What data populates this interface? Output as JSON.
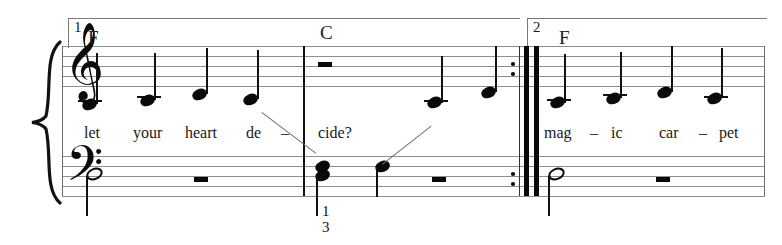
{
  "score": {
    "title_visible": false,
    "system": {
      "width": 782,
      "height": 245
    },
    "brace": {
      "name": "piano-brace"
    },
    "clefs": [
      {
        "name": "treble-clef",
        "glyph": "𝄞",
        "staff": "treble"
      },
      {
        "name": "bass-clef",
        "glyph": "𝄢",
        "staff": "bass"
      }
    ],
    "voltas": [
      {
        "number": "1",
        "name": "volta-1"
      },
      {
        "number": "2",
        "name": "volta-2"
      }
    ],
    "chords": [
      {
        "symbol": "F",
        "name": "chord-symbol-f-1"
      },
      {
        "symbol": "C",
        "name": "chord-symbol-c"
      },
      {
        "symbol": "F",
        "symbol_name": "chord-symbol-f-2"
      }
    ],
    "chord_list": [
      "F",
      "C",
      "F"
    ],
    "lyrics_measure_1": [
      {
        "text": "let"
      },
      {
        "text": "your"
      },
      {
        "text": "heart"
      },
      {
        "text": "de"
      },
      {
        "text": "–"
      }
    ],
    "lyrics_measure_2": [
      {
        "text": "cide?"
      }
    ],
    "lyrics_measure_3": [
      {
        "text": "mag"
      },
      {
        "text": "–"
      },
      {
        "text": "ic"
      },
      {
        "text": "car"
      },
      {
        "text": "–"
      },
      {
        "text": "pet"
      }
    ],
    "fingerings": [
      {
        "value": "1",
        "name": "fingering-1"
      },
      {
        "value": "3",
        "name": "fingering-3"
      }
    ],
    "rests": [
      {
        "type": "half-rest",
        "staff": "treble",
        "measure": 2
      },
      {
        "type": "half-rest",
        "staff": "bass",
        "measure": 1
      },
      {
        "type": "half-rest",
        "staff": "bass",
        "measure": 2
      },
      {
        "type": "half-rest",
        "staff": "bass",
        "measure": 3
      }
    ],
    "repeat_barline": {
      "name": "end-repeat-barline",
      "dots": 4
    },
    "colors": {
      "ink": "#0a0a0a",
      "staff": "#8e8e8e",
      "paper": "#ffffff"
    }
  }
}
